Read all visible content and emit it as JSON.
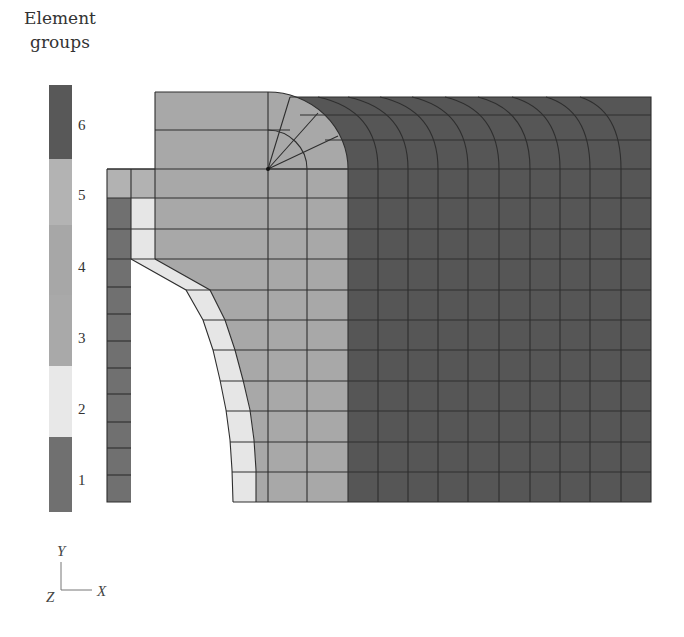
{
  "legend": {
    "title_line1": "Element",
    "title_line2": "groups",
    "groups": [
      {
        "id": "1",
        "label": "1",
        "color": "#707070"
      },
      {
        "id": "2",
        "label": "2",
        "color": "#e8e8e8"
      },
      {
        "id": "3",
        "label": "3",
        "color": "#a9a9a9"
      },
      {
        "id": "4",
        "label": "4",
        "color": "#a9a9a9"
      },
      {
        "id": "5",
        "label": "5",
        "color": "#b5b5b5"
      },
      {
        "id": "6",
        "label": "6",
        "color": "#585858"
      }
    ]
  },
  "mesh": {
    "line_color": "#2a2a2a",
    "region_colors": {
      "group1": "#707070",
      "group2": "#e6e6e6",
      "group3": "#a8a8a8",
      "group5": "#b2b2b2",
      "group6": "#565656"
    }
  },
  "axes": {
    "y_label": "Y",
    "x_label": "X",
    "z_label": "Z"
  }
}
